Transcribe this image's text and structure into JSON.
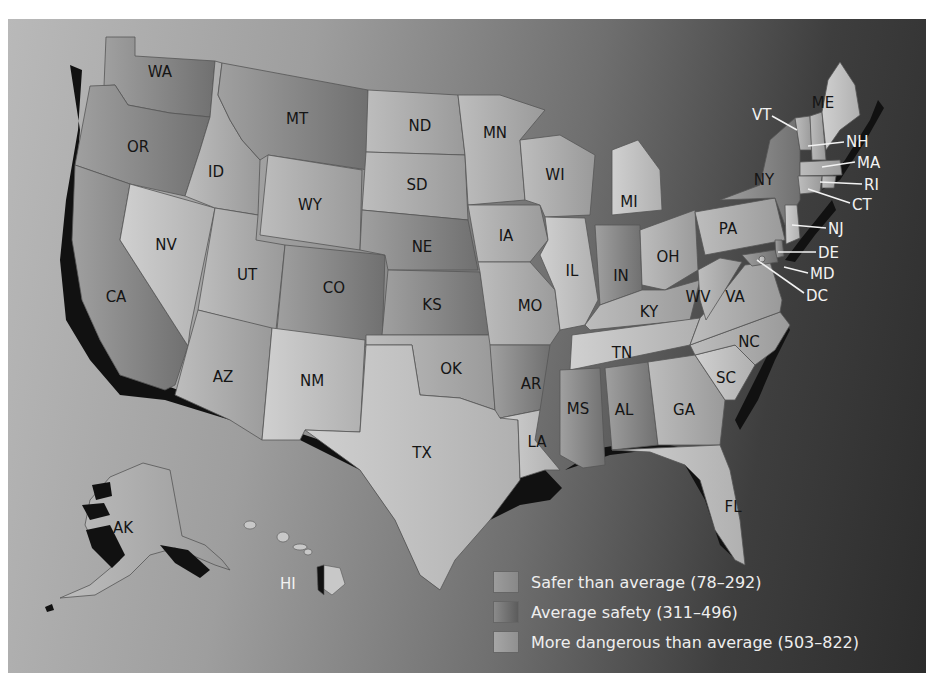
{
  "map": {
    "title": "",
    "colors": {
      "safer": "#a9a9a9",
      "average": "#8a8a8a",
      "dangerous": "#c4c4c4",
      "coast_shadow": "#111111"
    },
    "states": [
      {
        "abbr": "WA",
        "category": "average"
      },
      {
        "abbr": "OR",
        "category": "average"
      },
      {
        "abbr": "CA",
        "category": "average"
      },
      {
        "abbr": "NV",
        "category": "dangerous"
      },
      {
        "abbr": "ID",
        "category": "safer"
      },
      {
        "abbr": "MT",
        "category": "average"
      },
      {
        "abbr": "WY",
        "category": "safer"
      },
      {
        "abbr": "UT",
        "category": "safer"
      },
      {
        "abbr": "CO",
        "category": "average"
      },
      {
        "abbr": "AZ",
        "category": "safer"
      },
      {
        "abbr": "NM",
        "category": "dangerous"
      },
      {
        "abbr": "ND",
        "category": "safer"
      },
      {
        "abbr": "SD",
        "category": "safer"
      },
      {
        "abbr": "NE",
        "category": "average"
      },
      {
        "abbr": "KS",
        "category": "average"
      },
      {
        "abbr": "OK",
        "category": "safer"
      },
      {
        "abbr": "TX",
        "category": "dangerous"
      },
      {
        "abbr": "MN",
        "category": "safer"
      },
      {
        "abbr": "IA",
        "category": "safer"
      },
      {
        "abbr": "MO",
        "category": "safer"
      },
      {
        "abbr": "AR",
        "category": "average"
      },
      {
        "abbr": "LA",
        "category": "dangerous"
      },
      {
        "abbr": "WI",
        "category": "safer"
      },
      {
        "abbr": "IL",
        "category": "dangerous"
      },
      {
        "abbr": "MI",
        "category": "dangerous"
      },
      {
        "abbr": "IN",
        "category": "average"
      },
      {
        "abbr": "OH",
        "category": "safer"
      },
      {
        "abbr": "KY",
        "category": "safer"
      },
      {
        "abbr": "TN",
        "category": "dangerous"
      },
      {
        "abbr": "MS",
        "category": "average"
      },
      {
        "abbr": "AL",
        "category": "average"
      },
      {
        "abbr": "GA",
        "category": "safer"
      },
      {
        "abbr": "FL",
        "category": "dangerous"
      },
      {
        "abbr": "SC",
        "category": "dangerous"
      },
      {
        "abbr": "NC",
        "category": "safer"
      },
      {
        "abbr": "VA",
        "category": "safer"
      },
      {
        "abbr": "WV",
        "category": "safer"
      },
      {
        "abbr": "PA",
        "category": "safer"
      },
      {
        "abbr": "NY",
        "category": "average"
      },
      {
        "abbr": "VT",
        "category": "safer"
      },
      {
        "abbr": "NH",
        "category": "safer"
      },
      {
        "abbr": "ME",
        "category": "dangerous"
      },
      {
        "abbr": "MA",
        "category": "safer"
      },
      {
        "abbr": "RI",
        "category": "safer"
      },
      {
        "abbr": "CT",
        "category": "safer"
      },
      {
        "abbr": "NJ",
        "category": "dangerous"
      },
      {
        "abbr": "DE",
        "category": "average"
      },
      {
        "abbr": "MD",
        "category": "average"
      },
      {
        "abbr": "DC",
        "category": "dangerous"
      },
      {
        "abbr": "AK",
        "category": "safer"
      },
      {
        "abbr": "HI",
        "category": "safer"
      }
    ],
    "labels": {
      "WA": "WA",
      "OR": "OR",
      "CA": "CA",
      "NV": "NV",
      "ID": "ID",
      "MT": "MT",
      "WY": "WY",
      "UT": "UT",
      "CO": "CO",
      "AZ": "AZ",
      "NM": "NM",
      "ND": "ND",
      "SD": "SD",
      "NE": "NE",
      "KS": "KS",
      "OK": "OK",
      "TX": "TX",
      "MN": "MN",
      "IA": "IA",
      "MO": "MO",
      "AR": "AR",
      "LA": "LA",
      "WI": "WI",
      "IL": "IL",
      "MI": "MI",
      "IN": "IN",
      "OH": "OH",
      "KY": "KY",
      "TN": "TN",
      "MS": "MS",
      "AL": "AL",
      "GA": "GA",
      "FL": "FL",
      "SC": "SC",
      "NC": "NC",
      "VA": "VA",
      "WV": "WV",
      "PA": "PA",
      "NY": "NY",
      "VT": "VT",
      "NH": "NH",
      "ME": "ME",
      "MA": "MA",
      "RI": "RI",
      "CT": "CT",
      "NJ": "NJ",
      "DE": "DE",
      "MD": "MD",
      "DC": "DC",
      "AK": "AK",
      "HI": "HI"
    }
  },
  "legend": {
    "items": [
      {
        "label": "Safer than average (78–292)",
        "range": [
          78,
          292
        ],
        "key": "safer"
      },
      {
        "label": "Average safety (311–496)",
        "range": [
          311,
          496
        ],
        "key": "average"
      },
      {
        "label": "More dangerous than average (503–822)",
        "range": [
          503,
          822
        ],
        "key": "dangerous"
      }
    ]
  }
}
